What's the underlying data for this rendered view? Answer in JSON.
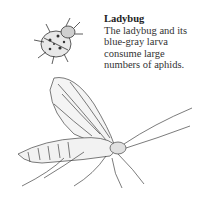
{
  "caption": {
    "title": "Ladybug",
    "body_lines": [
      "The ladybug and its",
      "blue-gray larva",
      "consume large",
      "numbers of aphids."
    ]
  },
  "illustrations": {
    "top": "ladybug-illustration",
    "bottom": "lacewing-illustration"
  },
  "colors": {
    "ink": "#2a2a2a",
    "background": "#ffffff"
  }
}
